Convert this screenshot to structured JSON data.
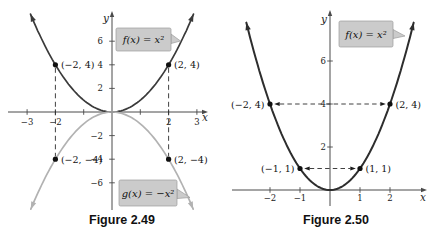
{
  "chart_data": [
    {
      "type": "line",
      "caption": "Figure 2.49",
      "xlabel": "x",
      "ylabel": "y",
      "xlim": [
        -3.5,
        3.4
      ],
      "ylim": [
        -8.4,
        8.4
      ],
      "grid": false,
      "legend": "callout-boxes",
      "series": [
        {
          "name": "f(x) = x²",
          "expression": "y = x^2",
          "color": "#3a3a3a",
          "x_draw_range": [
            -2.88,
            2.88
          ]
        },
        {
          "name": "g(x) = −x²",
          "expression": "y = -x^2",
          "color": "#b2b2b2",
          "x_draw_range": [
            -2.87,
            2.87
          ]
        }
      ],
      "x_ticks": [
        {
          "v": -3,
          "label": "−3"
        },
        {
          "v": -2,
          "label": "−2"
        },
        {
          "v": -1,
          "label": ""
        },
        {
          "v": 1,
          "label": ""
        },
        {
          "v": 2,
          "label": "2"
        },
        {
          "v": 3,
          "label": "3"
        }
      ],
      "y_ticks": [
        {
          "v": 6,
          "label": "6"
        },
        {
          "v": 4,
          "label": "4"
        },
        {
          "v": 2,
          "label": "2"
        },
        {
          "v": -2,
          "label": "−2"
        },
        {
          "v": -4,
          "label": "−4"
        },
        {
          "v": -6,
          "label": "−6"
        }
      ],
      "points": [
        {
          "x": -2,
          "y": 4,
          "label": "(−2, 4)",
          "side": "right"
        },
        {
          "x": 2,
          "y": 4,
          "label": "(2, 4)",
          "side": "right"
        },
        {
          "x": -2,
          "y": -4,
          "label": "(−2, −4)",
          "side": "right"
        },
        {
          "x": 2,
          "y": -4,
          "label": "(2, −4)",
          "side": "right"
        }
      ],
      "dashed_connectors": [
        {
          "from": [
            -2,
            4
          ],
          "to": [
            -2,
            -4
          ],
          "arrows": false
        },
        {
          "from": [
            2,
            4
          ],
          "to": [
            2,
            -4
          ],
          "arrows": false
        }
      ]
    },
    {
      "type": "line",
      "caption": "Figure 2.50",
      "xlabel": "x",
      "ylabel": "y",
      "xlim": [
        -3.3,
        3.2
      ],
      "ylim": [
        -0.6,
        8.2
      ],
      "grid": false,
      "legend": "callout-boxes",
      "series": [
        {
          "name": "f(x) = x²",
          "expression": "y = x^2",
          "color": "#2d2d2d",
          "x_draw_range": [
            -2.79,
            2.79
          ]
        }
      ],
      "x_ticks": [
        {
          "v": -2,
          "label": "−2"
        },
        {
          "v": -1,
          "label": "−1"
        },
        {
          "v": 1,
          "label": "1"
        },
        {
          "v": 2,
          "label": "2"
        }
      ],
      "y_ticks": [
        {
          "v": 6,
          "label": "6"
        },
        {
          "v": 4,
          "label": "4"
        },
        {
          "v": 2,
          "label": "2"
        }
      ],
      "points": [
        {
          "x": -2,
          "y": 4,
          "label": "(−2, 4)",
          "side": "left"
        },
        {
          "x": 2,
          "y": 4,
          "label": "(2, 4)",
          "side": "right"
        },
        {
          "x": -1,
          "y": 1,
          "label": "(−1, 1)",
          "side": "left"
        },
        {
          "x": 1,
          "y": 1,
          "label": "(1, 1)",
          "side": "right"
        }
      ],
      "dashed_connectors": [
        {
          "from": [
            -2,
            4
          ],
          "to": [
            2,
            4
          ],
          "arrows": true
        },
        {
          "from": [
            -1,
            1
          ],
          "to": [
            1,
            1
          ],
          "arrows": true
        }
      ]
    }
  ]
}
